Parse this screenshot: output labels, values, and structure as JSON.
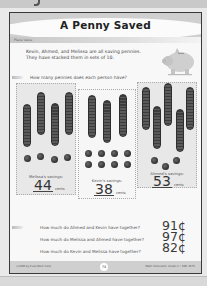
{
  "worksheet": {
    "title": "A Penny Saved",
    "section": "Place Value",
    "intro_line1": "Kevin, Ahmed, and Melissa are all saving pennies.",
    "intro_line2": "They have stacked them in sets of 10.",
    "prompt": "How many pennies does each person have?",
    "decor_icon": "piggy-bank-icon"
  },
  "panels": [
    {
      "name": "Melissa",
      "label": "Melissa's savings:",
      "stacks_of_ten": 4,
      "single_pennies": 4,
      "value": "44",
      "unit": "cents"
    },
    {
      "name": "Kevin",
      "label": "Kevin's savings:",
      "stacks_of_ten": 3,
      "single_pennies": 8,
      "value": "38",
      "unit": "cents"
    },
    {
      "name": "Ahmed",
      "label": "Ahmed's savings:",
      "stacks_of_ten": 5,
      "single_pennies": 3,
      "value": "53",
      "unit": "cents"
    }
  ],
  "questions": [
    {
      "text": "How much do Ahmed and Kevin have together?",
      "answer": "91¢"
    },
    {
      "text": "How much do Melissa and Ahmed have together?",
      "answer": "97¢"
    },
    {
      "text": "How much do Kevin and Melissa have together?",
      "answer": "82¢"
    }
  ],
  "footer": {
    "left": "©2006 by Evan-Moor Corp.",
    "page_number": "74",
    "right": "Math Homework, Grade 2 • EMC 4575"
  }
}
